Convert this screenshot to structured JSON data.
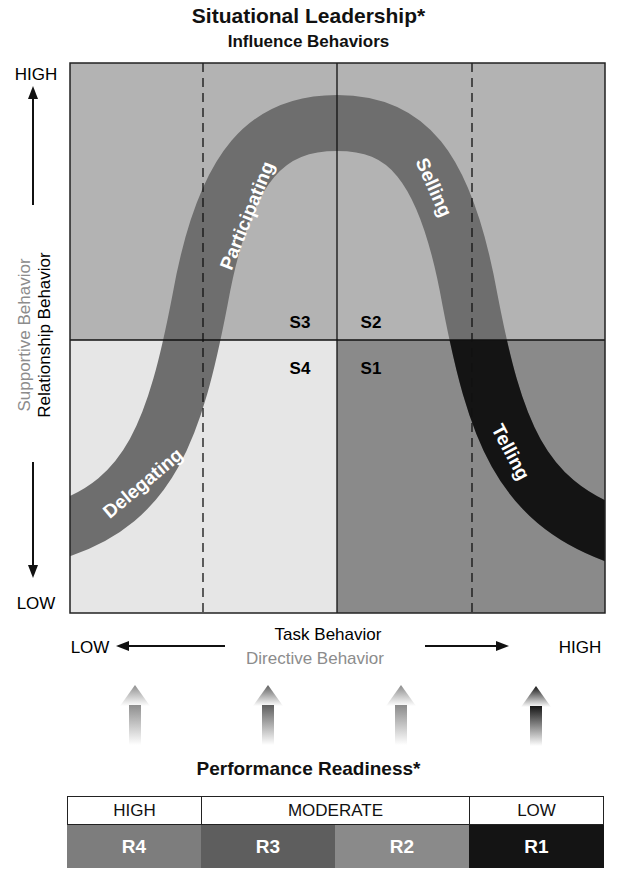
{
  "title": "Situational Leadership*",
  "subtitle": "Influence Behaviors",
  "y_axis": {
    "high": "HIGH",
    "low": "LOW",
    "label_primary": "Relationship Behavior",
    "label_secondary": "Supportive Behavior"
  },
  "x_axis": {
    "low": "LOW",
    "high": "HIGH",
    "label_primary": "Task Behavior",
    "label_secondary": "Directive Behavior"
  },
  "quadrants": {
    "S3": "S3",
    "S2": "S2",
    "S4": "S4",
    "S1": "S1"
  },
  "curve_labels": {
    "delegating": "Delegating",
    "participating": "Participating",
    "selling": "Selling",
    "telling": "Telling"
  },
  "readiness": {
    "title": "Performance Readiness*",
    "levels": [
      {
        "label": "HIGH",
        "span": 1
      },
      {
        "label": "MODERATE",
        "span": 2
      },
      {
        "label": "LOW",
        "span": 1
      }
    ],
    "cells": [
      {
        "label": "R4",
        "color": "#7d7d7d"
      },
      {
        "label": "R3",
        "color": "#5e5e5e"
      },
      {
        "label": "R2",
        "color": "#8a8a8a"
      },
      {
        "label": "R1",
        "color": "#141414"
      }
    ]
  },
  "colors": {
    "top_bg": "#b3b3b3",
    "bottom_left_bg": "#e6e6e6",
    "bottom_right_bg": "#8a8a8a",
    "curve_main": "#6e6e6e",
    "curve_telling": "#141414",
    "curve_delegating": "#7a7a7a",
    "secondary_text": "#8c8c8c"
  }
}
